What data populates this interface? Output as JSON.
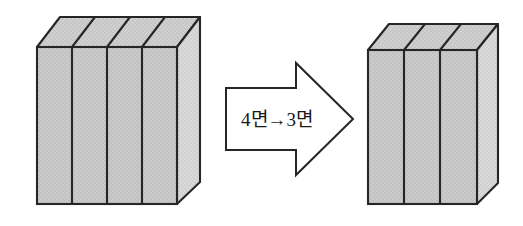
{
  "diagram": {
    "background_color": "#ffffff",
    "stroke_color": "#262626",
    "face_fill_front": "#c9c9c9",
    "face_fill_top": "#cccccc",
    "face_fill_side": "#d6d6d6",
    "left_box": {
      "name": "four-panel-box",
      "panel_count": "4",
      "front": {
        "x": 37,
        "y": 47,
        "width": 140,
        "height": 157
      },
      "depth": {
        "dx": 23,
        "dy": -30
      },
      "panel_dividers_x": [
        72,
        107,
        142
      ]
    },
    "right_box": {
      "name": "three-panel-box",
      "panel_count": "3",
      "front": {
        "x": 368,
        "y": 50,
        "width": 109,
        "height": 154
      },
      "depth": {
        "dx": 21,
        "dy": -26
      },
      "panel_dividers_x": [
        404,
        440
      ]
    },
    "arrow": {
      "name": "transformation-arrow",
      "direction": "right",
      "label": "4면→3면",
      "label_from": "4면",
      "label_to": "3면",
      "label_connector": "→",
      "shaft": {
        "x": 226,
        "y": 88,
        "width": 82,
        "height": 62
      },
      "head": {
        "tip_x": 353,
        "tip_y": 119,
        "base_x": 296,
        "top_y": 63,
        "bottom_y": 175
      },
      "fill": "#ffffff",
      "stroke": "#262626"
    }
  }
}
